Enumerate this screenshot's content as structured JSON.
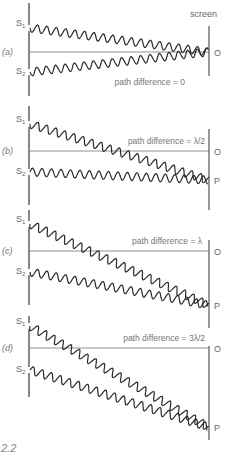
{
  "figure": {
    "number_label": "2.2",
    "screen_label": "screen",
    "panels": [
      {
        "id": "a",
        "label": "(a)",
        "path_difference": "path difference = 0",
        "s1": {
          "name": "S",
          "sub": "1",
          "y": 28
        },
        "s2": {
          "name": "S",
          "sub": "2",
          "y": 72
        },
        "center_y": 52,
        "barrier": [
          3,
          96
        ],
        "screen": [
          26,
          76
        ],
        "O": "O",
        "P": null,
        "target_y": 52,
        "label_y": 85,
        "label_x": 185
      },
      {
        "id": "b",
        "label": "(b)",
        "path_difference": "path difference = λ/2",
        "s1": {
          "name": "S",
          "sub": "1",
          "y": 124
        },
        "s2": {
          "name": "S",
          "sub": "2",
          "y": 172
        },
        "center_y": 151,
        "barrier": [
          106,
          205
        ],
        "screen": [
          129,
          210
        ],
        "O": "O",
        "P": "P",
        "target_y": 180,
        "label_y": 144,
        "label_x": 205
      },
      {
        "id": "c",
        "label": "(c)",
        "path_difference": "path difference = λ",
        "s1": {
          "name": "S",
          "sub": "1",
          "y": 224
        },
        "s2": {
          "name": "S",
          "sub": "2",
          "y": 272
        },
        "center_y": 251,
        "barrier": [
          210,
          305
        ],
        "screen": [
          240,
          328
        ],
        "O": "O",
        "P": "P",
        "target_y": 305,
        "label_y": 244,
        "label_x": 202
      },
      {
        "id": "d",
        "label": "(d)",
        "path_difference": "path difference = 3λ/2",
        "s1": {
          "name": "S",
          "sub": "1",
          "y": 326
        },
        "s2": {
          "name": "S",
          "sub": "2",
          "y": 370
        },
        "center_y": 348,
        "barrier": [
          316,
          397
        ],
        "screen": [
          346,
          440
        ],
        "O": "O",
        "P": "P",
        "target_y": 427,
        "label_y": 341,
        "label_x": 205
      }
    ]
  },
  "colors": {
    "wave": "#2a2a2a",
    "line": "#555555",
    "text": "#777777"
  },
  "geometry": {
    "barrier_x": 29,
    "screen_x": 209,
    "wave_amplitude": 4,
    "wavelength": 9.5
  }
}
